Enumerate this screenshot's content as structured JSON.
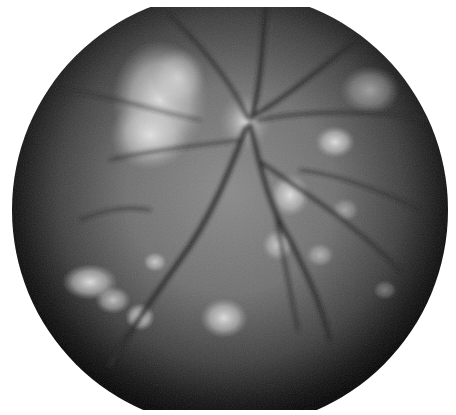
{
  "image": {
    "subject": "fundus-photograph",
    "mode": "grayscale",
    "background_color": "#ffffff",
    "field": {
      "cx": 230,
      "cy": 210,
      "r": 218,
      "clip_top": 7,
      "clip_bottom": 410
    },
    "tones": {
      "dark_rim": "#0a0a0a",
      "mid_retina": "#6e6e6e",
      "bright_patch": "#d8d8d8",
      "vessel": "#262626"
    }
  }
}
